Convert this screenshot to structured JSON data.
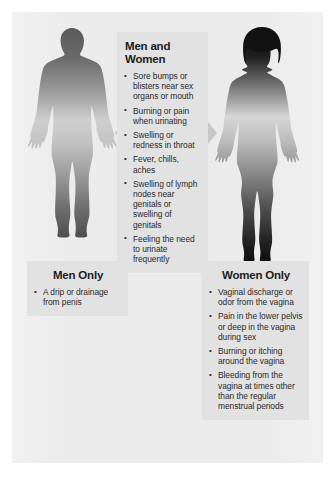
{
  "poster": {
    "background_color": "#ebebeb",
    "panel_color": "#e2e2e2",
    "arrow_color": "#c7c7c7",
    "text_color": "#2a2a2a"
  },
  "figures": {
    "male": {
      "name": "male-silhouette",
      "gradient_top_color": "#5f5f5f",
      "gradient_mid_color": "#d0d0d0",
      "gradient_bottom_color": "#555555"
    },
    "female": {
      "name": "female-silhouette",
      "gradient_top_color": "#1e1e1e",
      "gradient_mid_color": "#d8d8d8",
      "gradient_bottom_color": "#131313"
    }
  },
  "arrows": {
    "left": {
      "icon": "triangle-left-icon"
    },
    "right": {
      "icon": "triangle-right-icon"
    }
  },
  "panels": {
    "both": {
      "title": "Men and Women",
      "bullets": [
        "Sore bumps or blisters near sex organs or mouth",
        "Burning or pain when urinating",
        "Swelling or redness in throat",
        "Fever, chills, aches",
        "Swelling of lymph nodes near genitals or swelling of genitals",
        "Feeling the need to urinate frequently"
      ]
    },
    "men": {
      "title": "Men Only",
      "bullets": [
        "A drip or drainage from penis"
      ]
    },
    "women": {
      "title": "Women Only",
      "bullets": [
        "Vaginal discharge or odor from the vagina",
        "Pain in the lower pelvis or deep in the vagina during sex",
        "Burning or itching around the vagina",
        "Bleeding from the vagina at times other than the regular menstrual periods"
      ]
    }
  }
}
